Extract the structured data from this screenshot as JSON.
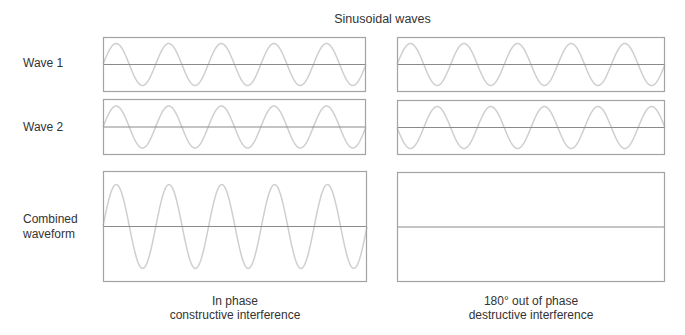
{
  "title": "Sinusoidal waves",
  "rows": [
    {
      "label": "Wave 1"
    },
    {
      "label": "Wave 2"
    },
    {
      "label_line1": "Combined",
      "label_line2": "waveform"
    }
  ],
  "columns": [
    {
      "caption_line1": "In phase",
      "caption_line2": "constructive interference"
    },
    {
      "caption_line1": "180° out of phase",
      "caption_line2": "destructive interference"
    }
  ],
  "colors": {
    "border": "#a3a3a3",
    "axis": "#8a8a8a",
    "wave": "#cfcfcf",
    "text": "#333333"
  },
  "chart_data": {
    "type": "line",
    "title": "Sinusoidal waves",
    "cycles_per_panel": 5,
    "panels": [
      {
        "column": "In phase / constructive interference",
        "row": "Wave 1",
        "amplitude": 1,
        "phase_deg": 0
      },
      {
        "column": "In phase / constructive interference",
        "row": "Wave 2",
        "amplitude": 1,
        "phase_deg": 0
      },
      {
        "column": "In phase / constructive interference",
        "row": "Combined waveform",
        "amplitude": 2,
        "phase_deg": 0
      },
      {
        "column": "180° out of phase / destructive interference",
        "row": "Wave 1",
        "amplitude": 1,
        "phase_deg": 0
      },
      {
        "column": "180° out of phase / destructive interference",
        "row": "Wave 2",
        "amplitude": 1,
        "phase_deg": 180
      },
      {
        "column": "180° out of phase / destructive interference",
        "row": "Combined waveform",
        "amplitude": 0,
        "phase_deg": 0
      }
    ]
  },
  "layout_panels": [
    {
      "x": 103,
      "y": 37,
      "w": 263,
      "h": 55,
      "amp_px": 21,
      "phase_deg": 0,
      "cycles": 5
    },
    {
      "x": 103,
      "y": 99,
      "w": 263,
      "h": 56,
      "amp_px": 21,
      "phase_deg": 0,
      "cycles": 5
    },
    {
      "x": 103,
      "y": 171,
      "w": 264,
      "h": 111,
      "amp_px": 42,
      "phase_deg": 0,
      "cycles": 5
    },
    {
      "x": 397,
      "y": 37,
      "w": 268,
      "h": 55,
      "amp_px": 21,
      "phase_deg": 0,
      "cycles": 5
    },
    {
      "x": 397,
      "y": 100,
      "w": 268,
      "h": 55,
      "amp_px": 21,
      "phase_deg": 180,
      "cycles": 5
    },
    {
      "x": 397,
      "y": 172,
      "w": 268,
      "h": 110,
      "amp_px": 0,
      "phase_deg": 0,
      "cycles": 5
    }
  ]
}
